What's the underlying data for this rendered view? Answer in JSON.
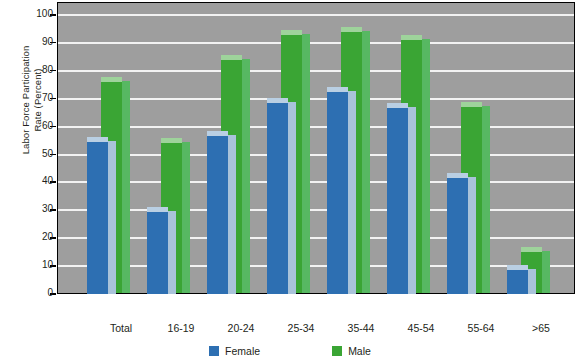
{
  "chart_data": {
    "type": "bar",
    "title": "",
    "xlabel": "",
    "ylabel": "Labor Force Participation Rate (Percent)",
    "ylabel_line1": "Labor Force Participation",
    "ylabel_line2": "Rate (Percent)",
    "ylim": [
      0,
      100
    ],
    "ytick_step": 10,
    "yticks": [
      "0",
      "10",
      "20",
      "30",
      "40",
      "50",
      "60",
      "70",
      "80",
      "90",
      "100"
    ],
    "grid": true,
    "legend_position": "bottom-center",
    "categories": [
      "Total",
      "16-19",
      "20-24",
      "25-34",
      "35-44",
      "45-54",
      "55-64",
      ">65"
    ],
    "series": [
      {
        "name": "Female",
        "color": "#2d6fb2",
        "values": [
          56,
          31,
          58,
          70,
          74,
          68,
          43,
          10
        ]
      },
      {
        "name": "Male",
        "color": "#3aa534",
        "values": [
          76,
          54,
          84,
          93,
          94,
          91,
          67,
          15
        ]
      }
    ],
    "plot_background": "#9e9e9e",
    "gridline_color": "#f2f2f2"
  },
  "legend": {
    "items": [
      {
        "label": "Female",
        "color": "#2d6fb2"
      },
      {
        "label": "Male",
        "color": "#3aa534"
      }
    ]
  }
}
